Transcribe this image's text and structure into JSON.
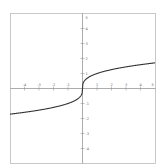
{
  "chart_data": {
    "type": "line",
    "title": "",
    "function": "y = cbrt(x)",
    "xlabel": "",
    "ylabel": "",
    "xlim": [
      -5,
      5
    ],
    "ylim": [
      -5,
      5
    ],
    "grid": false,
    "x_ticks": [
      -4,
      -3,
      -2,
      -1,
      1,
      2,
      3,
      4
    ],
    "y_ticks": [
      -4,
      -3,
      -2,
      -1,
      1,
      2,
      3,
      4
    ],
    "x_end_label": "5",
    "y_end_label": "5",
    "series": [
      {
        "name": "cube root",
        "x": [
          -5,
          -4,
          -3,
          -2,
          -1,
          -0.5,
          -0.1,
          0,
          0.1,
          0.5,
          1,
          2,
          3,
          4,
          5
        ],
        "y": [
          -1.71,
          -1.587,
          -1.442,
          -1.26,
          -1,
          -0.794,
          -0.464,
          0,
          0.464,
          0.794,
          1,
          1.26,
          1.442,
          1.587,
          1.71
        ]
      }
    ],
    "colors": {
      "curve": "#333333",
      "axes": "#888888",
      "frame": "#bbbbbb"
    }
  }
}
